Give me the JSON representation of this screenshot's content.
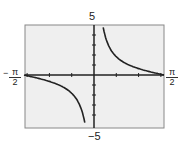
{
  "chart_data": {
    "type": "line",
    "title": "",
    "function": "y = cot x",
    "xlabel": "",
    "ylabel": "",
    "xlim": [
      "-π/2",
      "π/2"
    ],
    "ylim": [
      -5,
      5
    ],
    "tick_labels": {
      "x_left": {
        "sign": "−",
        "num": "π",
        "den": "2"
      },
      "x_right": {
        "num": "π",
        "den": "2"
      },
      "y_top": "5",
      "y_bottom": "−5"
    },
    "grid": false,
    "series": [
      {
        "name": "cot x",
        "x": [
          -1.5708,
          -1.2,
          -0.8,
          -0.5,
          -0.3,
          -0.2
        ],
        "y": [
          0,
          -0.39,
          -0.97,
          -1.83,
          -3.23,
          -4.93
        ]
      },
      {
        "name": "cot x",
        "x": [
          0.2,
          0.3,
          0.5,
          0.8,
          1.2,
          1.5708
        ],
        "y": [
          4.93,
          3.23,
          1.83,
          0.97,
          0.39,
          0
        ]
      }
    ],
    "background": "#f0f0f0",
    "line_color": "#222222"
  }
}
